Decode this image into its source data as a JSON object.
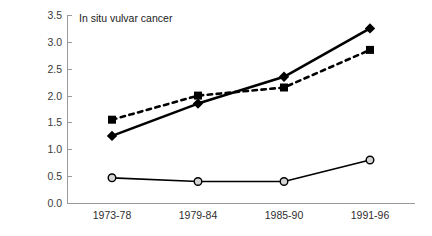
{
  "chart_data": {
    "type": "line",
    "title": "In situ vulvar cancer",
    "xlabel": "",
    "ylabel": "Incidence/100,000",
    "categories": [
      "1973-78",
      "1979-84",
      "1985-90",
      "1991-96"
    ],
    "ylim": [
      0.0,
      3.5
    ],
    "yticks": [
      "0.0",
      "0.5",
      "1.0",
      "1.5",
      "2.0",
      "2.5",
      "3.0",
      "3.5"
    ],
    "grid": false,
    "legend": "none",
    "series": [
      {
        "name": "diamond-solid-series",
        "marker": "diamond",
        "line_style": "solid",
        "color": "#000000",
        "values": [
          1.25,
          1.85,
          2.35,
          3.25
        ]
      },
      {
        "name": "square-dashed-series",
        "marker": "square",
        "line_style": "dashed",
        "color": "#000000",
        "values": [
          1.55,
          2.0,
          2.15,
          2.85
        ]
      },
      {
        "name": "circle-solid-series",
        "marker": "open-circle",
        "line_style": "solid",
        "color": "#000000",
        "values": [
          0.47,
          0.4,
          0.4,
          0.8
        ]
      }
    ]
  },
  "axis": {
    "color": "#9a9a9a"
  }
}
